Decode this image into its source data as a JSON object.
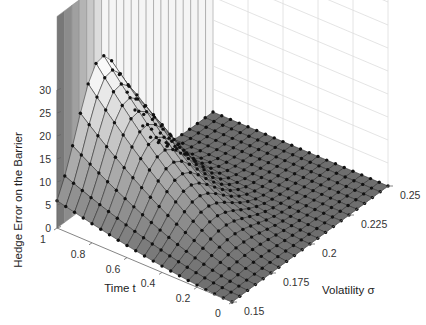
{
  "chart_data": {
    "type": "surface3d",
    "title": "",
    "xlabel": "Time t",
    "ylabel": "Volatility σ",
    "zlabel": "Hedge Error on the Barrier",
    "x_ticks": [
      "0",
      "0.2",
      "0.4",
      "0.6",
      "0.8",
      "1"
    ],
    "y_ticks": [
      "0.15",
      "0.175",
      "0.2",
      "0.225",
      "0.25"
    ],
    "z_ticks": [
      "0",
      "5",
      "10",
      "15",
      "20",
      "25",
      "30"
    ],
    "xlim": [
      0,
      1
    ],
    "ylim": [
      0.15,
      0.25
    ],
    "zlim": [
      0,
      30
    ],
    "grid": true,
    "colormap": "gray",
    "markers": "filled-circle",
    "grid_t_count": 21,
    "grid_sigma_count": 21
  },
  "axes": {
    "z_label": "Hedge Error on the Barrier",
    "x_label": "Time t",
    "y_label": "Volatility σ"
  }
}
